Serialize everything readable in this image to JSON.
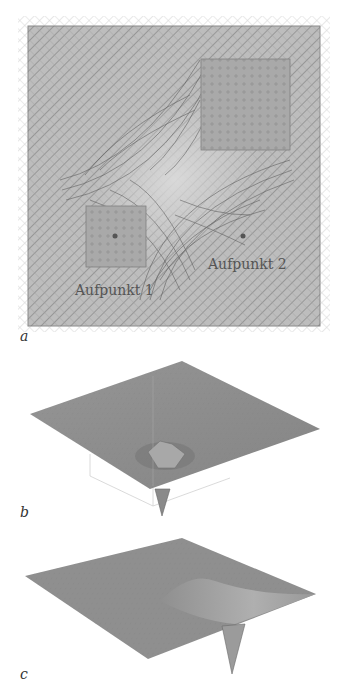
{
  "figure": {
    "panels": [
      {
        "id": "a",
        "label": "a",
        "kind": "deformed-grid-field",
        "annotations": [
          {
            "text": "Aufpunkt 1",
            "point": "left-lower square center"
          },
          {
            "text": "Aufpunkt 2",
            "point": "right lower field point"
          }
        ]
      },
      {
        "id": "b",
        "label": "b",
        "kind": "3d-surface",
        "description": "flat plane with single deep funnel near center"
      },
      {
        "id": "c",
        "label": "c",
        "kind": "3d-surface",
        "description": "plane with ridge and deep funnel toward right edge"
      }
    ],
    "colors": {
      "grid_line": "#6a6a6a",
      "field_bg": "#b9b9b9",
      "square_fill": "#a8a8a8",
      "surface": "#8e8e8e",
      "point": "#555555"
    }
  },
  "labels": {
    "a": "a",
    "b": "b",
    "c": "c",
    "aufpunkt1": "Aufpunkt 1",
    "aufpunkt2": "Aufpunkt 2"
  }
}
